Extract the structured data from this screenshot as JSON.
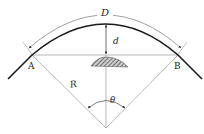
{
  "diagram": {
    "labels": {
      "D": "D",
      "d": "d",
      "A": "A",
      "B": "B",
      "R": "R",
      "theta": "θ"
    },
    "colors": {
      "curve": "#1a1a1a",
      "thin_line": "#888888",
      "hatch": "#555555"
    }
  }
}
